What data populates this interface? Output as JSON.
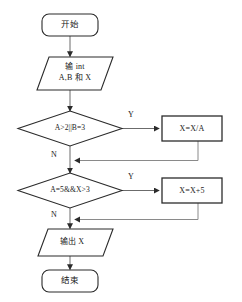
{
  "diagram": {
    "colors": {
      "node_stroke": "#2b2b2b",
      "node_fill": "#ffffff",
      "edge_stroke": "#6b6b6b",
      "main_edge_stroke": "#4a4a4a",
      "text": "#1a1a1a",
      "background": "#ffffff"
    },
    "nodes": [
      {
        "id": "start",
        "shape": "terminal",
        "label": "开始"
      },
      {
        "id": "input",
        "shape": "parallelogram",
        "label_line1": "输 int",
        "label_line2": "A,B 和 X"
      },
      {
        "id": "decision1",
        "shape": "diamond",
        "label": "A>2||B=3"
      },
      {
        "id": "process1",
        "shape": "rectangle",
        "label": "X=X/A"
      },
      {
        "id": "decision2",
        "shape": "diamond",
        "label": "A=5&&X>3"
      },
      {
        "id": "process2",
        "shape": "rectangle",
        "label": "X=X+5"
      },
      {
        "id": "output",
        "shape": "parallelogram",
        "label": "输出 X"
      },
      {
        "id": "end",
        "shape": "terminal",
        "label": "结束"
      }
    ],
    "edge_labels": {
      "decision1_yes": "Y",
      "decision1_no": "N",
      "decision2_yes": "Y",
      "decision2_no": "N"
    }
  }
}
